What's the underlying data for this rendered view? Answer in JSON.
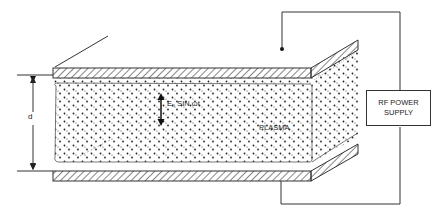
{
  "diagram": {
    "type": "capacitively-coupled RF plasma reactor (parallel plate)",
    "labels": {
      "gap": "d",
      "field": "E₀ SIN ωt",
      "plasma": "PLASMA",
      "power_supply_line1": "RF POWER",
      "power_supply_line2": "SUPPLY"
    },
    "components": [
      {
        "id": "top-electrode",
        "kind": "hatched plate"
      },
      {
        "id": "bottom-electrode",
        "kind": "hatched plate"
      },
      {
        "id": "plasma-region",
        "kind": "stippled volume"
      },
      {
        "id": "rf-power-supply",
        "kind": "box"
      },
      {
        "id": "field-arrow",
        "kind": "double-headed arrow"
      },
      {
        "id": "gap-dimension",
        "kind": "dimension line"
      }
    ],
    "colors": {
      "line": "#333333",
      "background": "#ffffff"
    }
  }
}
